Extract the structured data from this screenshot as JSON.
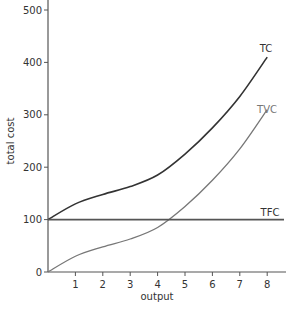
{
  "chart_data": {
    "type": "line",
    "title": "",
    "xlabel": "output",
    "ylabel": "total cost",
    "x": [
      0,
      1,
      2,
      3,
      4,
      5,
      6,
      7,
      8
    ],
    "xticks": [
      "1",
      "2",
      "3",
      "4",
      "5",
      "6",
      "7",
      "8"
    ],
    "yticks": [
      "0",
      "100",
      "200",
      "300",
      "400",
      "500"
    ],
    "xlim": [
      0,
      8.5
    ],
    "ylim": [
      0,
      500
    ],
    "grid": false,
    "legend": "inline labels at line ends",
    "series": [
      {
        "name": "TC",
        "color": "#333333",
        "values": [
          100,
          130,
          148,
          163,
          185,
          225,
          275,
          335,
          410
        ]
      },
      {
        "name": "TVC",
        "color": "#777777",
        "values": [
          0,
          30,
          48,
          63,
          85,
          125,
          175,
          235,
          310
        ]
      },
      {
        "name": "TFC",
        "color": "#555555",
        "values": [
          100,
          100,
          100,
          100,
          100,
          100,
          100,
          100,
          100
        ]
      }
    ]
  }
}
